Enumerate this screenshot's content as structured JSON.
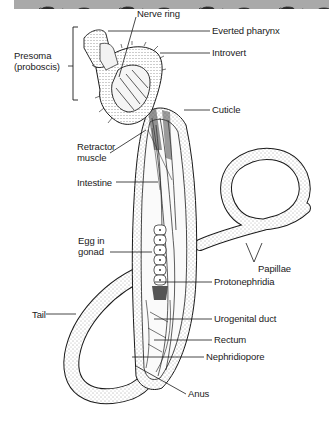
{
  "figure": {
    "banner": {
      "color": "#a9a9a9",
      "motif": "worm-silhouette-icon",
      "repeat": 8
    }
  },
  "labels": {
    "nerve_ring": "Nerve ring",
    "everted_pharynx": "Everted pharynx",
    "introvert": "Introvert",
    "presoma": "Presoma\n(proboscis)",
    "cuticle": "Cuticle",
    "retractor_muscle": "Retractor\nmuscle",
    "intestine": "Intestine",
    "egg_in_gonad": "Egg in\ngonad",
    "papillae": "Papillae",
    "protonephridia": "Protonephridia",
    "tail": "Tail",
    "urogenital_duct": "Urogenital duct",
    "rectum": "Rectum",
    "nephridiopore": "Nephridiopore",
    "anus": "Anus"
  },
  "colors": {
    "ink": "#1a1a1a",
    "stipple": "#e6e6e6",
    "background": "#ffffff"
  }
}
